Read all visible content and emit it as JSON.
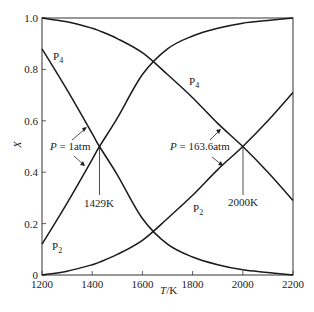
{
  "chart_data": {
    "type": "line",
    "title": "",
    "xlabel": "T/K",
    "ylabel": "X",
    "xlim": [
      1200,
      2200
    ],
    "ylim": [
      0,
      1.0
    ],
    "xticks": [
      1200,
      1400,
      1600,
      1800,
      2000,
      2200
    ],
    "xtick_labels": [
      "1200",
      "1400",
      "1600",
      "1800",
      "2000",
      "2200"
    ],
    "yticks": [
      0,
      0.2,
      0.4,
      0.6,
      0.8,
      1.0
    ],
    "ytick_labels": [
      "0",
      "0.2",
      "0.4",
      "0.6",
      "0.8",
      "1.0"
    ],
    "grid": false,
    "legend": "none (inline labels)",
    "x": [
      1200,
      1300,
      1400,
      1429,
      1500,
      1600,
      1700,
      1800,
      1900,
      2000,
      2100,
      2200
    ],
    "series": [
      {
        "name": "P4 (P = 1atm)",
        "label": "P4",
        "values": [
          0.88,
          0.72,
          0.55,
          0.5,
          0.39,
          0.22,
          0.12,
          0.07,
          0.04,
          0.02,
          0.01,
          0.0
        ]
      },
      {
        "name": "P2 (P = 1atm)",
        "label": "P2",
        "values": [
          0.12,
          0.28,
          0.45,
          0.5,
          0.61,
          0.78,
          0.88,
          0.93,
          0.96,
          0.98,
          0.99,
          1.0
        ]
      },
      {
        "name": "P4 (P = 163.6atm)",
        "label": "P4",
        "values": [
          1.0,
          0.985,
          0.96,
          0.95,
          0.92,
          0.865,
          0.78,
          0.69,
          0.59,
          0.5,
          0.4,
          0.29
        ]
      },
      {
        "name": "P2 (P = 163.6atm)",
        "label": "P2",
        "values": [
          0.0,
          0.015,
          0.04,
          0.05,
          0.08,
          0.135,
          0.22,
          0.31,
          0.41,
          0.5,
          0.6,
          0.71
        ]
      }
    ],
    "annotations": [
      {
        "text": "P = 1atm",
        "x": 1429,
        "y": 0.5
      },
      {
        "text": "1429K",
        "x": 1429,
        "y": 0.5
      },
      {
        "text": "P = 163.6atm",
        "x": 2000,
        "y": 0.5
      },
      {
        "text": "2000K",
        "x": 2000,
        "y": 0.5
      }
    ]
  },
  "labels": {
    "p4_left": "P",
    "p4_left_sub": "4",
    "p2_left": "P",
    "p2_left_sub": "2",
    "p4_right": "P",
    "p4_right_sub": "4",
    "p2_right": "P",
    "p2_right_sub": "2",
    "p1_italic": "P",
    "p1_rest": " = 1atm",
    "p163_italic": "P",
    "p163_rest": " = 163.6atm",
    "t1": "1429K",
    "t2": "2000K",
    "xlabel_italic": "T",
    "xlabel_rest": "/K",
    "ylabel": "X"
  }
}
